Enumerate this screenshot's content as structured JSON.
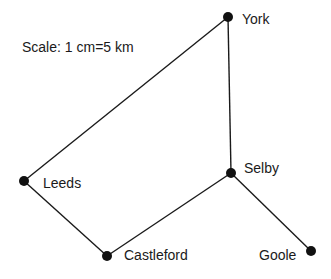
{
  "scale_label": "Scale: 1 cm=5 km",
  "colors": {
    "line": "#1a1a1a",
    "node": "#111111",
    "background": "#ffffff"
  },
  "nodes": [
    {
      "id": "york",
      "label": "York",
      "x": 228,
      "y": 17
    },
    {
      "id": "leeds",
      "label": "Leeds",
      "x": 24,
      "y": 181
    },
    {
      "id": "selby",
      "label": "Selby",
      "x": 231,
      "y": 173
    },
    {
      "id": "castleford",
      "label": "Castleford",
      "x": 107,
      "y": 256
    },
    {
      "id": "goole",
      "label": "Goole",
      "x": 311,
      "y": 251
    }
  ],
  "edges": [
    [
      "york",
      "leeds"
    ],
    [
      "york",
      "selby"
    ],
    [
      "leeds",
      "castleford"
    ],
    [
      "castleford",
      "selby"
    ],
    [
      "selby",
      "goole"
    ]
  ]
}
